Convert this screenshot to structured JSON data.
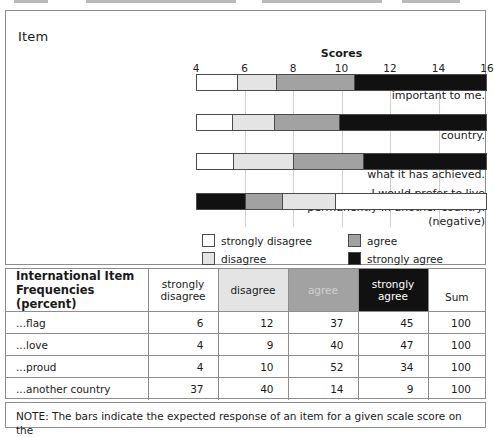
{
  "chart_panel": {
    "item_heading": "Item",
    "scores_heading": "Scores",
    "axis": {
      "ticks": [
        4,
        6,
        8,
        10,
        12,
        14,
        16
      ],
      "min": 4,
      "max": 16
    },
    "items": [
      {
        "label_line1": "The flag of this country is",
        "label_line2": "important to me.",
        "label_line3": ""
      },
      {
        "label_line1": "I have great love for this",
        "label_line2": "country.",
        "label_line3": ""
      },
      {
        "label_line1": "This country should be proud of",
        "label_line2": "what it has achieved.",
        "label_line3": ""
      },
      {
        "label_line1": "I would prefer to live",
        "label_line2": "permanently in another country.",
        "label_line3": "(negative)"
      }
    ],
    "legend": [
      {
        "key": "sd",
        "label": "strongly disagree"
      },
      {
        "key": "d",
        "label": "disagree"
      },
      {
        "key": "a",
        "label": "agree"
      },
      {
        "key": "sa",
        "label": "strongly agree"
      }
    ]
  },
  "chart_data": {
    "type": "bar",
    "orientation": "horizontal",
    "subtype": "stacked-boundary-segments",
    "title": "Scores",
    "xlabel": "Scores",
    "ylabel": "Item",
    "xlim": [
      4,
      16
    ],
    "xticks": [
      4,
      6,
      8,
      10,
      12,
      14,
      16
    ],
    "grid": true,
    "legend_position": "below",
    "categories": [
      "The flag of this country is important to me.",
      "I have great love for this country.",
      "This country should be proud of what it has achieved.",
      "I would prefer to live permanently in another country. (negative)"
    ],
    "series": [
      {
        "name": "strongly disagree",
        "color": "#ffffff"
      },
      {
        "name": "disagree",
        "color": "#e4e4e4"
      },
      {
        "name": "agree",
        "color": "#a2a2a2"
      },
      {
        "name": "strongly agree",
        "color": "#111111"
      }
    ],
    "bars": [
      {
        "category": "flag",
        "segments": [
          {
            "response": "strongly disagree",
            "start": 4.0,
            "end": 5.65
          },
          {
            "response": "disagree",
            "start": 5.65,
            "end": 7.3
          },
          {
            "response": "agree",
            "start": 7.3,
            "end": 10.5
          },
          {
            "response": "strongly agree",
            "start": 10.5,
            "end": 16.0
          }
        ]
      },
      {
        "category": "love",
        "segments": [
          {
            "response": "strongly disagree",
            "start": 4.0,
            "end": 5.45
          },
          {
            "response": "disagree",
            "start": 5.45,
            "end": 7.2
          },
          {
            "response": "agree",
            "start": 7.2,
            "end": 9.9
          },
          {
            "response": "strongly agree",
            "start": 9.9,
            "end": 16.0
          }
        ]
      },
      {
        "category": "proud",
        "segments": [
          {
            "response": "strongly disagree",
            "start": 4.0,
            "end": 5.5
          },
          {
            "response": "disagree",
            "start": 5.5,
            "end": 8.0
          },
          {
            "response": "agree",
            "start": 8.0,
            "end": 10.9
          },
          {
            "response": "strongly agree",
            "start": 10.9,
            "end": 16.0
          }
        ]
      },
      {
        "category": "another country",
        "segments": [
          {
            "response": "strongly agree",
            "start": 4.0,
            "end": 6.0
          },
          {
            "response": "agree",
            "start": 6.0,
            "end": 7.55
          },
          {
            "response": "disagree",
            "start": 7.55,
            "end": 9.75
          },
          {
            "response": "strongly disagree",
            "start": 9.75,
            "end": 16.0
          }
        ]
      }
    ]
  },
  "table": {
    "title_line1": "International Item",
    "title_line2": "Frequencies (percent)",
    "headers": [
      {
        "key": "sd",
        "line1": "strongly",
        "line2": "disagree"
      },
      {
        "key": "d",
        "line1": "disagree",
        "line2": ""
      },
      {
        "key": "a",
        "line1": "agree",
        "line2": ""
      },
      {
        "key": "sa",
        "line1": "strongly",
        "line2": "agree"
      },
      {
        "key": "sum",
        "line1": "",
        "line2": "Sum"
      }
    ],
    "rows": [
      {
        "label": "...flag",
        "sd": "6",
        "d": "12",
        "a": "37",
        "sa": "45",
        "sum": "100"
      },
      {
        "label": "...love",
        "sd": "4",
        "d": "9",
        "a": "40",
        "sa": "47",
        "sum": "100"
      },
      {
        "label": "...proud",
        "sd": "4",
        "d": "10",
        "a": "52",
        "sa": "34",
        "sum": "100"
      },
      {
        "label": "...another country",
        "sd": "37",
        "d": "40",
        "a": "14",
        "sa": "9",
        "sum": "100"
      }
    ]
  },
  "note": {
    "text": "NOTE: The bars indicate the expected response of an item for a given scale score on the"
  },
  "colors": {
    "strongly_disagree": "#ffffff",
    "disagree": "#e4e4e4",
    "agree": "#a2a2a2",
    "strongly_agree": "#111111",
    "border": "#8d8d8d",
    "gridline": "#cfcfcf"
  }
}
